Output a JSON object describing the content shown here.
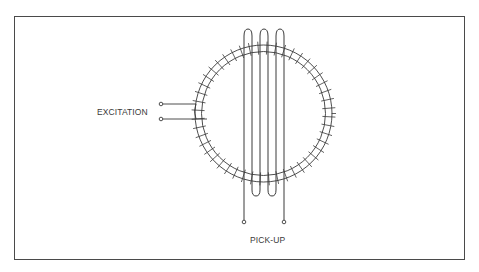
{
  "diagram": {
    "labels": {
      "excitation": "EXCITATION",
      "pickup": "PICK-UP"
    },
    "colors": {
      "line": "#3a3a3a",
      "background": "#ffffff",
      "frame": "#4a4a4a"
    },
    "components": [
      {
        "name": "toroidal-core",
        "type": "ring"
      },
      {
        "name": "excitation-winding",
        "type": "coil",
        "terminals": 2
      },
      {
        "name": "pickup-coil",
        "type": "loop-winding",
        "terminals": 2,
        "loops": 3
      }
    ]
  }
}
